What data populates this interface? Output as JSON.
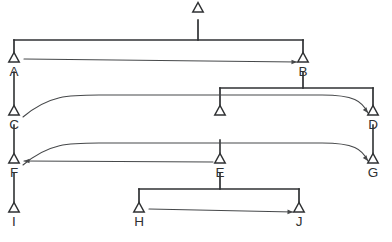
{
  "figure": {
    "type": "syntactic-tree-diagram",
    "title": "",
    "caption": "",
    "background_color": "#ffffff",
    "line_color": "#2f3133",
    "arrow_color": "#46484a"
  },
  "nodes": [
    {
      "id": "root",
      "label": "",
      "x": 198,
      "y": 12,
      "labeled": false
    },
    {
      "id": "A",
      "label": "A",
      "x": 14,
      "y": 62,
      "labeled": true
    },
    {
      "id": "B",
      "label": "B",
      "x": 303,
      "y": 62,
      "labeled": true
    },
    {
      "id": "C",
      "label": "C",
      "x": 14,
      "y": 115,
      "labeled": true
    },
    {
      "id": "mid",
      "label": "",
      "x": 220,
      "y": 115,
      "labeled": false
    },
    {
      "id": "D",
      "label": "D",
      "x": 373,
      "y": 115,
      "labeled": true
    },
    {
      "id": "F",
      "label": "F",
      "x": 14,
      "y": 163,
      "labeled": true
    },
    {
      "id": "E",
      "label": "E",
      "x": 220,
      "y": 163,
      "labeled": true
    },
    {
      "id": "G",
      "label": "G",
      "x": 373,
      "y": 163,
      "labeled": true
    },
    {
      "id": "I",
      "label": "I",
      "x": 14,
      "y": 212,
      "labeled": true
    },
    {
      "id": "H",
      "label": "H",
      "x": 139,
      "y": 212,
      "labeled": true
    },
    {
      "id": "J",
      "label": "J",
      "x": 299,
      "y": 212,
      "labeled": true
    }
  ],
  "brackets": [
    {
      "id": "root-to-A-B",
      "parent": "root",
      "bar_y": 40,
      "left_x": 14,
      "right_x": 303,
      "stem_x": 198,
      "stem_top": 20,
      "children": [
        "A",
        "B"
      ]
    },
    {
      "id": "B-to-mid-D",
      "parent": "B",
      "bar_y": 88,
      "left_x": 220,
      "right_x": 373,
      "stem_x": 303,
      "stem_top": 72,
      "children": [
        "mid",
        "D"
      ]
    },
    {
      "id": "E-to-H-J",
      "parent": "E",
      "bar_y": 189,
      "left_x": 139,
      "right_x": 299,
      "stem_x": 220,
      "stem_top": 173,
      "children": [
        "H",
        "J"
      ]
    }
  ],
  "straight_edges": [
    {
      "id": "A-to-C",
      "from": "A",
      "to": "C",
      "x": 14,
      "y1": 72,
      "y2": 107
    },
    {
      "id": "C-to-F",
      "from": "C",
      "to": "F",
      "x": 14,
      "y1": 125,
      "y2": 155
    },
    {
      "id": "F-to-I",
      "from": "F",
      "to": "I",
      "x": 14,
      "y1": 173,
      "y2": 204
    },
    {
      "id": "D-to-G",
      "from": "D",
      "to": "G",
      "x": 373,
      "y1": 125,
      "y2": 155
    },
    {
      "id": "mid-stem",
      "from": "bar",
      "to": "mid",
      "x": 220,
      "y1": 140,
      "y2": 155
    }
  ],
  "movement_arrows": [
    {
      "id": "A-to-B",
      "from": "A",
      "to": "B",
      "direction": "rightward",
      "shape": "straight",
      "start_x": 24,
      "start_y": 59,
      "end_x": 297,
      "end_y": 62
    },
    {
      "id": "C-to-D",
      "from": "C",
      "to": "D",
      "direction": "rightward",
      "shape": "curved",
      "start_x": 23,
      "start_y": 117,
      "end_x": 368,
      "end_y": 113
    },
    {
      "id": "F-to-G",
      "from": "F",
      "to": "G",
      "direction": "rightward",
      "shape": "curved",
      "start_x": 23,
      "start_y": 165,
      "end_x": 368,
      "end_y": 161
    },
    {
      "id": "E-to-F",
      "from": "E",
      "to": "F",
      "direction": "leftward",
      "shape": "straight",
      "start_x": 213,
      "start_y": 162,
      "end_x": 24,
      "end_y": 161
    },
    {
      "id": "H-to-J",
      "from": "H",
      "to": "J",
      "direction": "rightward",
      "shape": "straight",
      "start_x": 149,
      "start_y": 209,
      "end_x": 293,
      "end_y": 212
    }
  ]
}
